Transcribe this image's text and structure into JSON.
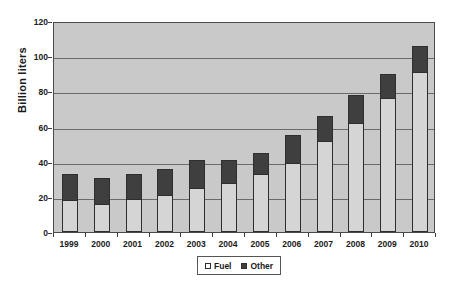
{
  "chart_data": {
    "type": "bar",
    "stacked": true,
    "title": "",
    "xlabel": "",
    "ylabel": "Billion liters",
    "ylim": [
      0,
      120
    ],
    "ytick_values": [
      0,
      20,
      40,
      60,
      80,
      100,
      120
    ],
    "ytick_labels": [
      "0",
      "20",
      "40",
      "60",
      "80",
      "100",
      "120"
    ],
    "grid": true,
    "legend_position": "bottom-center",
    "categories": [
      "1999",
      "2000",
      "2001",
      "2002",
      "2003",
      "2004",
      "2005",
      "2006",
      "2007",
      "2008",
      "2009",
      "2010"
    ],
    "series": [
      {
        "name": "Fuel",
        "color": "#d5d5d5",
        "values": [
          18,
          16,
          19,
          21,
          25,
          28,
          33,
          39,
          52,
          62,
          76,
          91
        ]
      },
      {
        "name": "Other",
        "color": "#3f3f3f",
        "values": [
          15,
          15,
          14,
          15,
          16,
          13,
          12,
          16,
          14,
          16,
          14,
          15
        ]
      }
    ],
    "totals": [
      33,
      31,
      33,
      36,
      41,
      41,
      45,
      55,
      66,
      78,
      90,
      106
    ]
  },
  "legend": {
    "items": [
      {
        "label": "Fuel",
        "swatch": "legend-swatch-fuel"
      },
      {
        "label": "Other",
        "swatch": "legend-swatch-other"
      }
    ]
  },
  "colors": {
    "plot_background": "#c9c9c9",
    "gridline": "#6b6b6b",
    "axis": "#4a4a4a",
    "fuel": "#d5d5d5",
    "other": "#3f3f3f",
    "text": "#1a1a1a",
    "page_background": "#ffffff"
  }
}
